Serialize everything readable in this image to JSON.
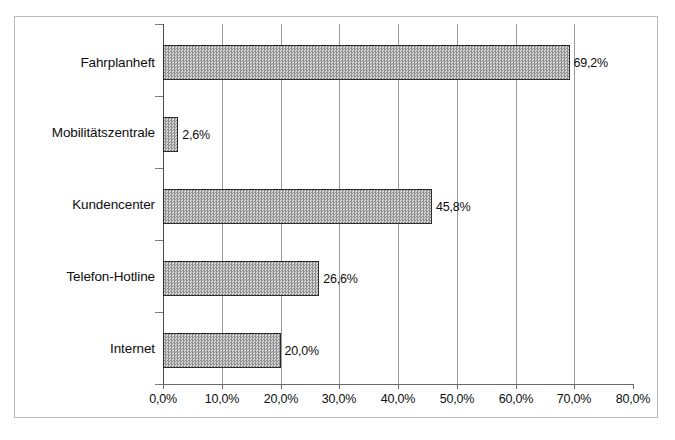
{
  "chart_data": {
    "type": "bar",
    "orientation": "horizontal",
    "title": "",
    "subtitle": "",
    "xlabel": "",
    "ylabel": "",
    "categories": [
      "Fahrplanheft",
      "Mobilitätszentrale",
      "Kundencenter",
      "Telefon-Hotline",
      "Internet"
    ],
    "values": [
      69.2,
      2.6,
      45.8,
      26.6,
      20.0
    ],
    "value_labels": [
      "69,2%",
      "2,6%",
      "45,8%",
      "26,6%",
      "20,0%"
    ],
    "xlim": [
      0,
      80
    ],
    "xticks": [
      0,
      10,
      20,
      30,
      40,
      50,
      60,
      70,
      80
    ],
    "xtick_labels": [
      "0,0%",
      "10,0%",
      "20,0%",
      "30,0%",
      "40,0%",
      "50,0%",
      "60,0%",
      "70,0%",
      "80,0%"
    ],
    "grid": true,
    "grid_axis": "x",
    "legend": false,
    "bar_fill_color": "#b5b5b5",
    "bar_border_color": "#2b2b2b",
    "gridline_color": "#9a9a9a",
    "axis_color": "#4a4a4a",
    "background_color": "#ffffff"
  }
}
